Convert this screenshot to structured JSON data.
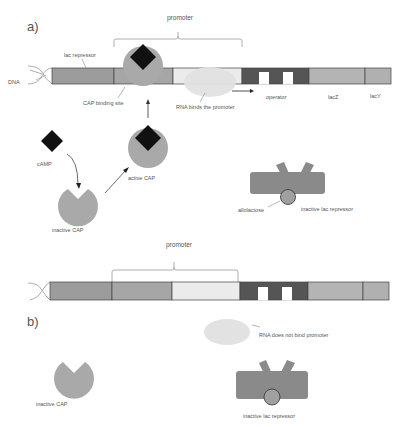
{
  "panel_a": {
    "label": "a)",
    "promoter_label": "promoter",
    "dna_label": "DNA",
    "lac_repressor_label": "lac repressor",
    "cap_binding_site_label": "CAP binding site",
    "rna_label": "RNA binds the promoter",
    "operator_label": "operator",
    "lacz_label": "lacZ",
    "lacy_label": "lacY",
    "camp_label": "cAMP",
    "active_cap_label": "active CAP",
    "inactive_cap_label": "inactive CAP",
    "allolactose_label": "allolactose",
    "inactive_repressor_label": "inactive lac repressor"
  },
  "panel_b": {
    "label": "b)",
    "promoter_label": "promoter",
    "rna_label": "RNA does not bind promoter",
    "inactive_cap_label": "inactive CAP",
    "inactive_repressor_label": "inactive lac repressor"
  },
  "colors": {
    "seg_repressor": "#9c9c9c",
    "seg_cap_site": "#a6a6a6",
    "seg_promoter": "#ebebeb",
    "seg_operator": "#555555",
    "seg_lacz": "#b4b4b4",
    "seg_lacy": "#b0b0b0",
    "cap": "#a9a9a9",
    "camp": "#111111",
    "rna": "#e2e2e2",
    "repressor": "#8a8a8a",
    "allolactose": "#a0a0a0"
  }
}
